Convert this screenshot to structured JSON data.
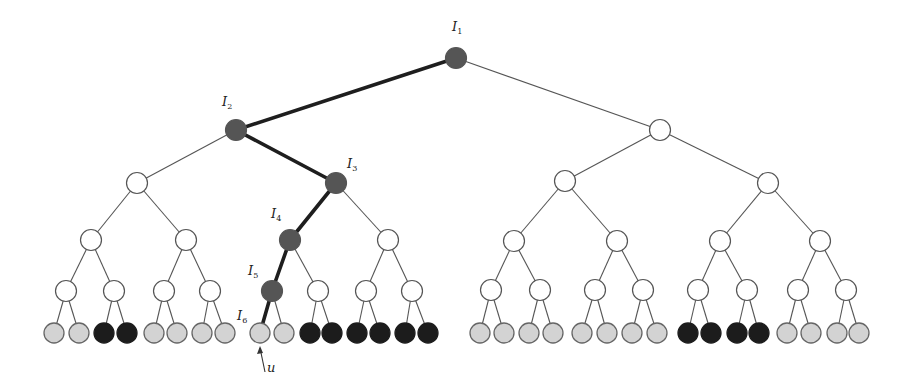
{
  "diagram": {
    "type": "binary-tree",
    "colors": {
      "path": "#555555",
      "white": "#ffffff",
      "light": "#d3d3d3",
      "dark": "#1c1c1c",
      "stroke": "#555555"
    },
    "internal_radius": 10.5,
    "leaf_radius": 10,
    "nodes": [
      {
        "id": "r",
        "x": 456,
        "y": 58,
        "fill": "path"
      },
      {
        "id": "L",
        "x": 236,
        "y": 130,
        "fill": "path"
      },
      {
        "id": "R",
        "x": 660,
        "y": 130,
        "fill": "white"
      },
      {
        "id": "LL",
        "x": 137,
        "y": 183,
        "fill": "white"
      },
      {
        "id": "LR",
        "x": 336,
        "y": 183,
        "fill": "path"
      },
      {
        "id": "RL",
        "x": 565,
        "y": 181,
        "fill": "white"
      },
      {
        "id": "RR",
        "x": 768,
        "y": 183,
        "fill": "white"
      },
      {
        "id": "LLL",
        "x": 91,
        "y": 240,
        "fill": "white"
      },
      {
        "id": "LLR",
        "x": 186,
        "y": 240,
        "fill": "white"
      },
      {
        "id": "LRL",
        "x": 290,
        "y": 240,
        "fill": "path"
      },
      {
        "id": "LRR",
        "x": 388,
        "y": 240,
        "fill": "white"
      },
      {
        "id": "RLL",
        "x": 514,
        "y": 241,
        "fill": "white"
      },
      {
        "id": "RLR",
        "x": 617,
        "y": 241,
        "fill": "white"
      },
      {
        "id": "RRL",
        "x": 720,
        "y": 241,
        "fill": "white"
      },
      {
        "id": "RRR",
        "x": 820,
        "y": 241,
        "fill": "white"
      },
      {
        "id": "n4_0",
        "x": 66,
        "y": 291,
        "fill": "white"
      },
      {
        "id": "n4_1",
        "x": 114,
        "y": 291,
        "fill": "white"
      },
      {
        "id": "n4_2",
        "x": 164,
        "y": 291,
        "fill": "white"
      },
      {
        "id": "n4_3",
        "x": 210,
        "y": 291,
        "fill": "white"
      },
      {
        "id": "n4_4",
        "x": 272,
        "y": 291,
        "fill": "path"
      },
      {
        "id": "n4_5",
        "x": 318,
        "y": 291,
        "fill": "white"
      },
      {
        "id": "n4_6",
        "x": 366,
        "y": 291,
        "fill": "white"
      },
      {
        "id": "n4_7",
        "x": 412,
        "y": 291,
        "fill": "white"
      },
      {
        "id": "n4_8",
        "x": 491,
        "y": 290,
        "fill": "white"
      },
      {
        "id": "n4_9",
        "x": 540,
        "y": 290,
        "fill": "white"
      },
      {
        "id": "n4_10",
        "x": 595,
        "y": 290,
        "fill": "white"
      },
      {
        "id": "n4_11",
        "x": 643,
        "y": 290,
        "fill": "white"
      },
      {
        "id": "n4_12",
        "x": 698,
        "y": 290,
        "fill": "white"
      },
      {
        "id": "n4_13",
        "x": 747,
        "y": 290,
        "fill": "white"
      },
      {
        "id": "n4_14",
        "x": 798,
        "y": 290,
        "fill": "white"
      },
      {
        "id": "n4_15",
        "x": 846,
        "y": 290,
        "fill": "white"
      }
    ],
    "leaves": {
      "y": 333,
      "x": [
        54,
        79,
        104,
        127,
        154,
        177,
        202,
        225,
        260,
        284,
        310,
        332,
        357,
        380,
        405,
        428,
        480,
        504,
        529,
        553,
        582,
        607,
        632,
        657,
        688,
        711,
        737,
        759,
        787,
        811,
        837,
        859
      ],
      "fill": [
        "light",
        "light",
        "dark",
        "dark",
        "light",
        "light",
        "light",
        "light",
        "light",
        "light",
        "dark",
        "dark",
        "dark",
        "dark",
        "dark",
        "dark",
        "light",
        "light",
        "light",
        "light",
        "light",
        "light",
        "light",
        "light",
        "dark",
        "dark",
        "dark",
        "dark",
        "light",
        "light",
        "light",
        "light"
      ]
    },
    "edges": [
      [
        "r",
        "L",
        true
      ],
      [
        "r",
        "R",
        false
      ],
      [
        "L",
        "LL",
        false
      ],
      [
        "L",
        "LR",
        true
      ],
      [
        "R",
        "RL",
        false
      ],
      [
        "R",
        "RR",
        false
      ],
      [
        "LL",
        "LLL",
        false
      ],
      [
        "LL",
        "LLR",
        false
      ],
      [
        "LR",
        "LRL",
        true
      ],
      [
        "LR",
        "LRR",
        false
      ],
      [
        "RL",
        "RLL",
        false
      ],
      [
        "RL",
        "RLR",
        false
      ],
      [
        "RR",
        "RRL",
        false
      ],
      [
        "RR",
        "RRR",
        false
      ],
      [
        "LLL",
        "n4_0",
        false
      ],
      [
        "LLL",
        "n4_1",
        false
      ],
      [
        "LLR",
        "n4_2",
        false
      ],
      [
        "LLR",
        "n4_3",
        false
      ],
      [
        "LRL",
        "n4_4",
        true
      ],
      [
        "LRL",
        "n4_5",
        false
      ],
      [
        "LRR",
        "n4_6",
        false
      ],
      [
        "LRR",
        "n4_7",
        false
      ],
      [
        "RLL",
        "n4_8",
        false
      ],
      [
        "RLL",
        "n4_9",
        false
      ],
      [
        "RLR",
        "n4_10",
        false
      ],
      [
        "RLR",
        "n4_11",
        false
      ],
      [
        "RRL",
        "n4_12",
        false
      ],
      [
        "RRL",
        "n4_13",
        false
      ],
      [
        "RRR",
        "n4_14",
        false
      ],
      [
        "RRR",
        "n4_15",
        false
      ]
    ],
    "bold_leaf_edge": 8,
    "labels": [
      {
        "text": "I",
        "sub": "1",
        "x": 452,
        "y": 31
      },
      {
        "text": "I",
        "sub": "2",
        "x": 222,
        "y": 106
      },
      {
        "text": "I",
        "sub": "3",
        "x": 347,
        "y": 168
      },
      {
        "text": "I",
        "sub": "4",
        "x": 271,
        "y": 218
      },
      {
        "text": "I",
        "sub": "5",
        "x": 248,
        "y": 275
      },
      {
        "text": "I",
        "sub": "6",
        "x": 237,
        "y": 320
      }
    ],
    "pointer": {
      "label": "u",
      "tail_x": 265,
      "tail_y": 372,
      "head_x": 260,
      "head_y": 346,
      "label_x": 267,
      "label_y": 372
    }
  }
}
